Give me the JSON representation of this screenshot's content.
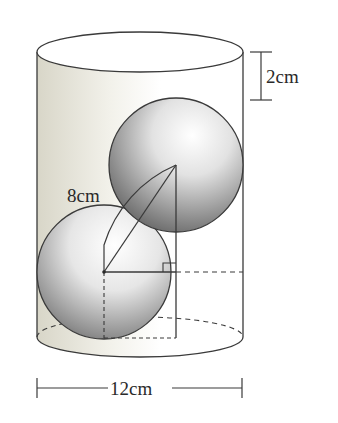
{
  "diagram": {
    "labels": {
      "top_gap": "2cm",
      "diagonal": "8cm",
      "diameter": "12cm"
    },
    "colors": {
      "stroke": "#3a3a3a",
      "cylinder_shade": "#e6e4d8",
      "sphere_dark": "#5a5a5a",
      "sphere_light": "#ffffff"
    }
  }
}
